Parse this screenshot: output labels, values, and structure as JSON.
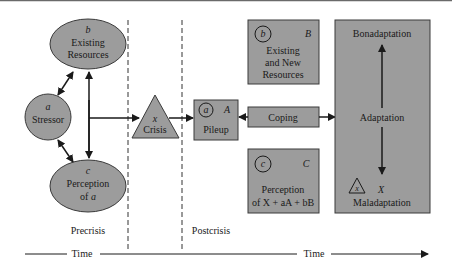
{
  "precrisis": {
    "resources": {
      "letter": "b",
      "line1": "Existing",
      "line2": "Resources"
    },
    "stressor": {
      "letter": "a",
      "label": "Stressor"
    },
    "perception": {
      "letter": "c",
      "line1": "Perception",
      "line2": "of",
      "line2_var": "a"
    },
    "label": "Precrisis"
  },
  "crisis": {
    "letter": "x",
    "label": "Crisis"
  },
  "postcrisis": {
    "label": "Postcrisis",
    "resources": {
      "circle_letter": "b",
      "letter": "B",
      "line1": "Existing",
      "line2": "and New",
      "line3": "Resources"
    },
    "pileup": {
      "circle_letter": "a",
      "letter": "A",
      "label": "Pileup"
    },
    "coping": {
      "label": "Coping"
    },
    "perception": {
      "circle_letter": "c",
      "letter": "C",
      "line1": "Perception",
      "line2": "of X + aA + bB"
    },
    "adaptation": {
      "top": "Bonadaptation",
      "middle": "Adaptation",
      "triangle_letter": "x",
      "letter": "X",
      "bottom": "Maladaptation"
    }
  },
  "time": {
    "left": "Time",
    "right": "Time"
  },
  "colors": {
    "shape_fill": "#9c9c9c",
    "stroke": "#1a1a1a"
  }
}
